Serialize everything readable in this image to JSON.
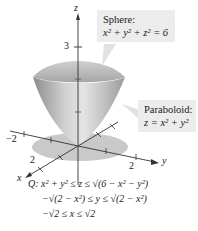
{
  "figure": {
    "axes": {
      "x_label": "x",
      "y_label": "y",
      "z_label": "z",
      "z_tick": "3",
      "x_tick": "2",
      "y_tick": "2",
      "neg_y_tick": "−2"
    },
    "sphere_callout": {
      "title": "Sphere:",
      "equation": "x² + y² + z² = 6"
    },
    "paraboloid_callout": {
      "title": "Paraboloid:",
      "equation": "z = x² + y²"
    },
    "region": {
      "name": "Q:",
      "line1": "x² + y² ≤ z ≤ √(6 − x² − y²)",
      "line2": "−√(2 − x²) ≤ y ≤ √(2 − x²)",
      "line3": "−√2 ≤ x ≤ √2"
    },
    "colors": {
      "surface_light": "#e6e6e6",
      "surface_dark": "#9a9a9a",
      "shadow": "#c8c8c8",
      "callout_bg": "#ececec",
      "axis": "#333333"
    }
  }
}
